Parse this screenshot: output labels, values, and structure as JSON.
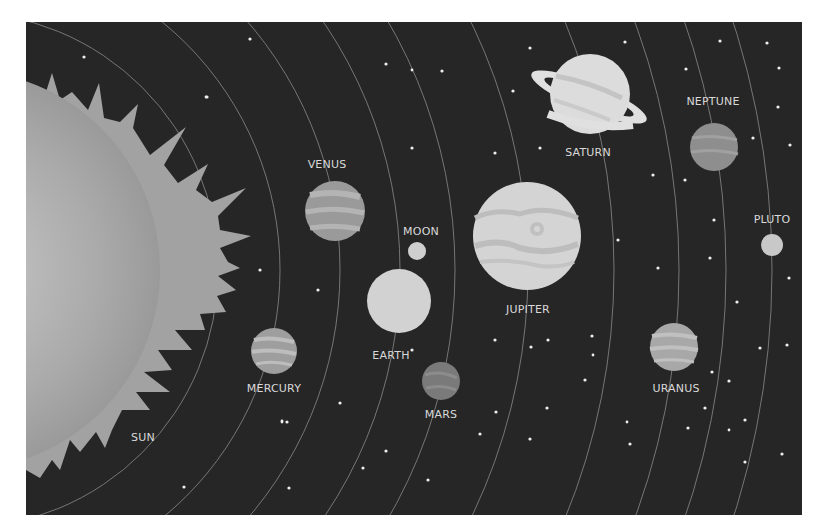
{
  "scene": {
    "background_color": "#262626",
    "orbit_color": "#8a8a8a",
    "star_color": "#eeeeee",
    "label_color": "#d9d9d9"
  },
  "bodies": {
    "sun": {
      "label": "SUN"
    },
    "mercury": {
      "label": "MERCURY"
    },
    "venus": {
      "label": "VENUS"
    },
    "earth": {
      "label": "EARTH"
    },
    "moon": {
      "label": "MOON"
    },
    "mars": {
      "label": "MARS"
    },
    "jupiter": {
      "label": "JUPITER"
    },
    "saturn": {
      "label": "SATURN"
    },
    "uranus": {
      "label": "URANUS"
    },
    "neptune": {
      "label": "NEPTUNE"
    },
    "pluto": {
      "label": "PLUTO"
    }
  }
}
